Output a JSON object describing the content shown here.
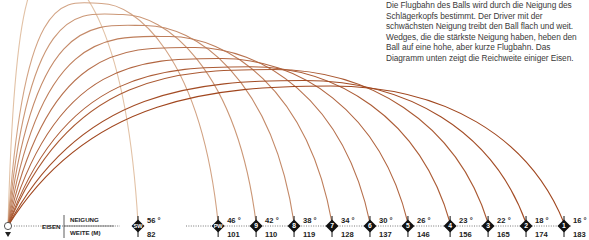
{
  "description": "Die Flugbahn des Balls wird durch die Neigung des Schlägerkopfs bestimmt. Der Driver mit der schwächsten Neigung treibt den Ball flach und weit. Wedges, die die stärkste Neigung haben, heben den Ball auf eine hohe, aber kurze Flugbahn. Das Diagramm unten zeigt die Reichweite einiger Eisen.",
  "legend": {
    "clubs_label": "EISEN",
    "loft_label": "NEIGUNG",
    "distance_label": "WEITE (M)"
  },
  "colors": {
    "curve_light": "#e2c2a6",
    "curve_dark": "#a0461e",
    "marker": "#111111",
    "text": "#3a3a3a"
  },
  "chart_data": {
    "type": "line",
    "title": "",
    "xlabel": "WEITE (M)",
    "ylabel": "",
    "legend_position": "none",
    "grid": false,
    "clubs": [
      {
        "id": "SW",
        "loft": "56 °",
        "distance": "82",
        "loft_deg": 56,
        "distance_m": 82
      },
      {
        "id": "PW",
        "loft": "46 °",
        "distance": "101",
        "loft_deg": 46,
        "distance_m": 101
      },
      {
        "id": "9",
        "loft": "42 °",
        "distance": "110",
        "loft_deg": 42,
        "distance_m": 110
      },
      {
        "id": "8",
        "loft": "38 °",
        "distance": "119",
        "loft_deg": 38,
        "distance_m": 119
      },
      {
        "id": "7",
        "loft": "34 °",
        "distance": "128",
        "loft_deg": 34,
        "distance_m": 128
      },
      {
        "id": "6",
        "loft": "30 °",
        "distance": "137",
        "loft_deg": 30,
        "distance_m": 137
      },
      {
        "id": "5",
        "loft": "26 °",
        "distance": "146",
        "loft_deg": 26,
        "distance_m": 146
      },
      {
        "id": "4",
        "loft": "23 °",
        "distance": "156",
        "loft_deg": 23,
        "distance_m": 156
      },
      {
        "id": "3",
        "loft": "22 °",
        "distance": "165",
        "loft_deg": 22,
        "distance_m": 165
      },
      {
        "id": "2",
        "loft": "18 °",
        "distance": "174",
        "loft_deg": 18,
        "distance_m": 174
      },
      {
        "id": "1",
        "loft": "16 °",
        "distance": "183",
        "loft_deg": 16,
        "distance_m": 183
      }
    ]
  }
}
